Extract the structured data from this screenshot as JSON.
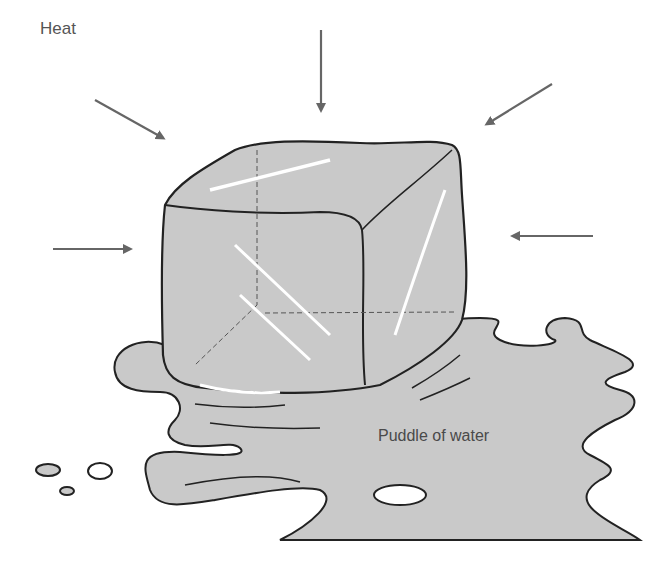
{
  "diagram": {
    "labels": {
      "heat": "Heat",
      "puddle": "Puddle of water"
    },
    "colors": {
      "ice_fill": "#c9c9c9",
      "puddle_fill": "#c9c9c9",
      "outline": "#222222",
      "arrow": "#666666",
      "highlight": "#ffffff",
      "background": "#ffffff"
    },
    "arrows": [
      {
        "name": "heat-arrow-top-left",
        "from": [
          95,
          100
        ],
        "to": [
          163,
          138
        ]
      },
      {
        "name": "heat-arrow-top",
        "from": [
          321,
          30
        ],
        "to": [
          321,
          110
        ]
      },
      {
        "name": "heat-arrow-top-right",
        "from": [
          552,
          84
        ],
        "to": [
          487,
          124
        ]
      },
      {
        "name": "heat-arrow-left",
        "from": [
          53,
          249
        ],
        "to": [
          130,
          249
        ]
      },
      {
        "name": "heat-arrow-right",
        "from": [
          593,
          236
        ],
        "to": [
          513,
          236
        ]
      }
    ]
  }
}
